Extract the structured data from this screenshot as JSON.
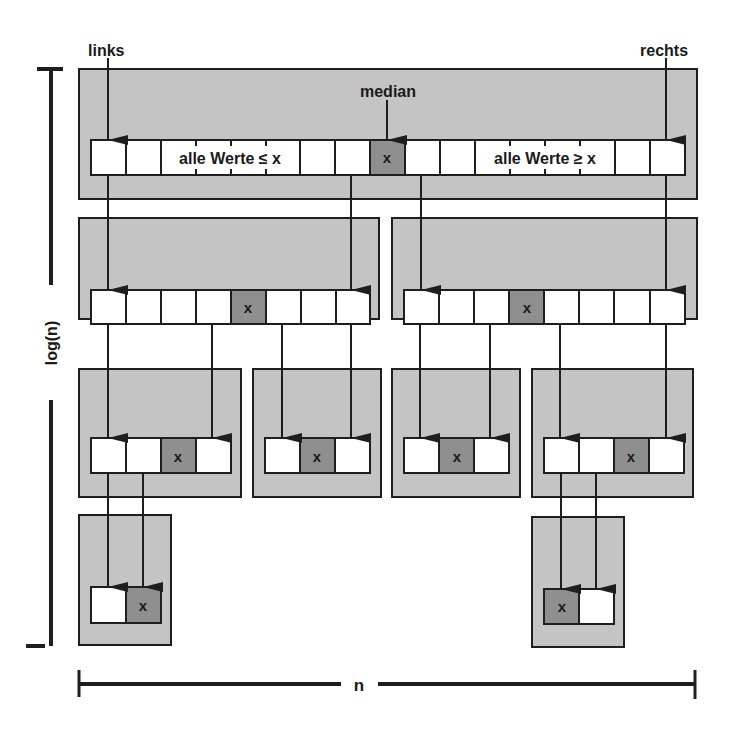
{
  "labels": {
    "left_pointer": "links",
    "right_pointer": "rechts",
    "median": "median",
    "left_region": "alle Werte ≤ x",
    "right_region": "alle Werte ≥ x",
    "median_symbol": "x",
    "height_axis": "log(n)",
    "width_axis": "n"
  },
  "colors": {
    "partition_fill": "#c4c4c4",
    "median_fill": "#8f8f8f",
    "cell_fill": "#ffffff",
    "stroke": "#1e1e1e"
  },
  "levels": [
    {
      "partitions": [
        {
          "box": [
            79,
            69,
            618,
            130
          ],
          "array_y": 140,
          "cells": [
            91,
            126,
            161,
            196,
            231,
            266,
            300,
            335,
            370,
            405,
            440,
            475,
            510,
            545,
            580,
            615,
            650
          ],
          "median_index": 8
        }
      ]
    },
    {
      "partitions": [
        {
          "box": [
            79,
            218,
            300,
            101
          ],
          "array_y": 290,
          "cells": [
            91,
            126,
            161,
            196,
            231,
            266,
            301,
            336
          ],
          "median_index": 4
        },
        {
          "box": [
            392,
            218,
            305,
            101
          ],
          "array_y": 290,
          "cells": [
            404,
            439,
            474,
            509,
            544,
            579,
            614,
            650
          ],
          "median_index": 3
        }
      ]
    },
    {
      "partitions": [
        {
          "box": [
            79,
            369,
            162,
            128
          ],
          "array_y": 438,
          "cells": [
            91,
            126,
            161,
            196
          ],
          "median_index": 2
        },
        {
          "box": [
            253,
            369,
            128,
            128
          ],
          "array_y": 438,
          "cells": [
            265,
            300,
            335
          ],
          "median_index": 1
        },
        {
          "box": [
            392,
            369,
            128,
            128
          ],
          "array_y": 438,
          "cells": [
            404,
            439,
            474
          ],
          "median_index": 1
        },
        {
          "box": [
            532,
            369,
            161,
            128
          ],
          "array_y": 438,
          "cells": [
            544,
            579,
            614,
            649
          ],
          "median_index": 2
        }
      ]
    },
    {
      "partitions": [
        {
          "box": [
            79,
            515,
            92,
            130
          ],
          "array_y": 587,
          "cells": [
            91,
            126
          ],
          "median_index": 1
        },
        {
          "box": [
            532,
            515,
            92,
            130
          ],
          "array_y": 587,
          "cells": [
            544,
            579
          ],
          "median_index": 0
        }
      ]
    }
  ]
}
